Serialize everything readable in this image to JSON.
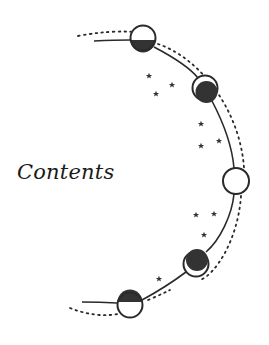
{
  "page": {
    "title": "Contents"
  },
  "illustration": {
    "description": "moon-phase arc",
    "colors": {
      "ink": "#2a2a2a",
      "dark_fill": "#333333",
      "paper": "#ffffff"
    },
    "phases": [
      {
        "name": "half-moon-bottom-dark",
        "cx": 143,
        "cy": 38
      },
      {
        "name": "crescent-upper-left-lit",
        "cx": 205,
        "cy": 90
      },
      {
        "name": "full-moon",
        "cx": 236,
        "cy": 181
      },
      {
        "name": "crescent-bottom-lit",
        "cx": 196,
        "cy": 262
      },
      {
        "name": "half-moon-top-dark",
        "cx": 130,
        "cy": 305
      }
    ],
    "star_count": 11
  }
}
